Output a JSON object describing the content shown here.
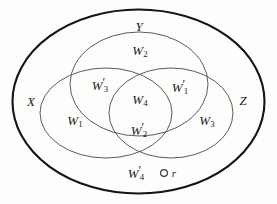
{
  "figure": {
    "name": "venn-diagram-three-sets",
    "background_color": "#fdfdfc",
    "stroke_color_outer": "#141414",
    "stroke_color_inner": "#4a4a4a"
  },
  "sets": [
    {
      "id": "universe",
      "label": "",
      "cx": 138.5,
      "cy": 101.5,
      "rx": 126,
      "ry": 92,
      "stroke_width": 2.1,
      "stroke": "#141414"
    },
    {
      "id": "set-y",
      "label": "Y",
      "cx": 139,
      "cy": 84,
      "rx": 69,
      "ry": 52,
      "stroke_width": 0.9,
      "stroke": "#4a4a4a"
    },
    {
      "id": "set-x",
      "label": "X",
      "cx": 106,
      "cy": 113,
      "rx": 66,
      "ry": 45,
      "stroke_width": 0.9,
      "stroke": "#4a4a4a"
    },
    {
      "id": "set-z",
      "label": "Z",
      "cx": 171,
      "cy": 113,
      "rx": 62,
      "ry": 45,
      "stroke_width": 0.9,
      "stroke": "#4a4a4a"
    }
  ],
  "set_labels": [
    {
      "name": "set-label-y",
      "text": "Y",
      "x": 139,
      "y": 26
    },
    {
      "name": "set-label-x",
      "text": "X",
      "x": 31,
      "y": 101
    },
    {
      "name": "set-label-z",
      "text": "Z",
      "x": 243,
      "y": 100
    }
  ],
  "region_labels": [
    {
      "name": "region-label-w2",
      "base": "W",
      "prime": false,
      "sub": "2",
      "x": 140,
      "y": 52,
      "region": "Y only"
    },
    {
      "name": "region-label-w3-prime",
      "base": "W",
      "prime": true,
      "sub": "3",
      "x": 100,
      "y": 85,
      "region": "X and Y"
    },
    {
      "name": "region-label-w1-prime",
      "base": "W",
      "prime": true,
      "sub": "1",
      "x": 180,
      "y": 87,
      "region": "Y and Z"
    },
    {
      "name": "region-label-w4",
      "base": "W",
      "prime": false,
      "sub": "4",
      "x": 140,
      "y": 101,
      "region": "X and Y and Z"
    },
    {
      "name": "region-label-w1",
      "base": "W",
      "prime": false,
      "sub": "1",
      "x": 75,
      "y": 122,
      "region": "X only"
    },
    {
      "name": "region-label-w2-prime",
      "base": "W",
      "prime": true,
      "sub": "2",
      "x": 139,
      "y": 130,
      "region": "X and Z"
    },
    {
      "name": "region-label-w3",
      "base": "W",
      "prime": false,
      "sub": "3",
      "x": 207,
      "y": 122,
      "region": "Z only"
    },
    {
      "name": "region-label-w4-prime",
      "base": "W",
      "prime": true,
      "sub": "4",
      "x": 136,
      "y": 173,
      "region": "universe only"
    }
  ],
  "points": [
    {
      "name": "point-r",
      "label": "r",
      "cx": 164,
      "cy": 173,
      "radius": 3.4,
      "label_x": 174,
      "label_y": 173
    }
  ]
}
